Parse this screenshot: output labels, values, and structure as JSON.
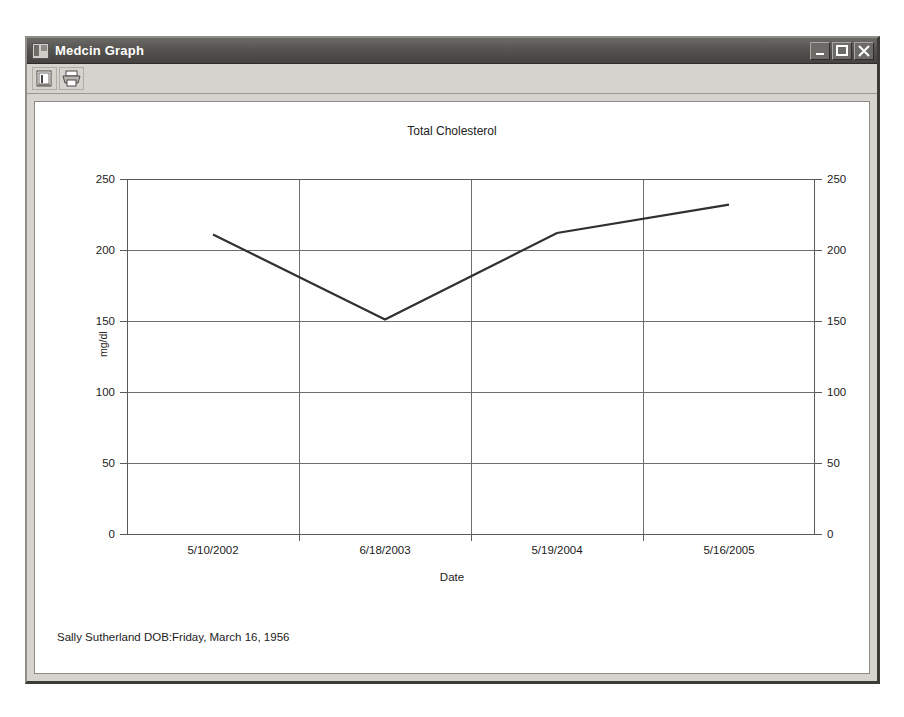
{
  "window": {
    "title": "Medcin Graph",
    "app_icon": "medcin-graph-icon",
    "controls": {
      "minimize_label": "_",
      "maximize_label": "□",
      "close_label": "✕"
    }
  },
  "toolbar": {
    "buttons": [
      {
        "name": "graph-view-button",
        "icon": "graph-view-icon",
        "label": ""
      },
      {
        "name": "print-button",
        "icon": "printer-icon",
        "label": ""
      }
    ]
  },
  "footer": {
    "patient_info": "Sally Sutherland DOB:Friday, March 16, 1956"
  },
  "chart_data": {
    "type": "line",
    "title": "Total Cholesterol",
    "xlabel": "Date",
    "ylabel": "mg/dl",
    "ylim": [
      0,
      250
    ],
    "yticks": [
      0,
      50,
      100,
      150,
      200,
      250
    ],
    "yticks_right": [
      0,
      50,
      100,
      150,
      200,
      250
    ],
    "grid": true,
    "legend": "none",
    "x_categories": [
      "5/10/2002",
      "6/18/2003",
      "5/19/2004",
      "5/16/2005"
    ],
    "series": [
      {
        "name": "Total Cholesterol",
        "color": "#303030",
        "points": [
          {
            "x": "5/10/2002",
            "value": 211
          },
          {
            "x": "6/18/2003",
            "value": 151
          },
          {
            "x": "5/19/2004",
            "value": 212
          },
          {
            "x": "5/16/2005",
            "value": 232
          }
        ]
      }
    ]
  }
}
